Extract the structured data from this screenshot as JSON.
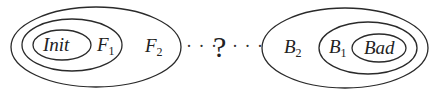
{
  "diagram": {
    "left_group": {
      "sets": [
        {
          "id": "init",
          "label": "Init",
          "subscript": ""
        },
        {
          "id": "f1",
          "label": "F",
          "subscript": "1"
        },
        {
          "id": "f2",
          "label": "F",
          "subscript": "2"
        }
      ]
    },
    "connector": {
      "left_dots": "· · ·",
      "question": "?",
      "right_dots": "· · ·"
    },
    "right_group": {
      "sets": [
        {
          "id": "b2",
          "label": "B",
          "subscript": "2"
        },
        {
          "id": "b1",
          "label": "B",
          "subscript": "1"
        },
        {
          "id": "bad",
          "label": "Bad",
          "subscript": ""
        }
      ]
    },
    "stroke_color": "#2a2a2a",
    "background": "#ffffff"
  }
}
